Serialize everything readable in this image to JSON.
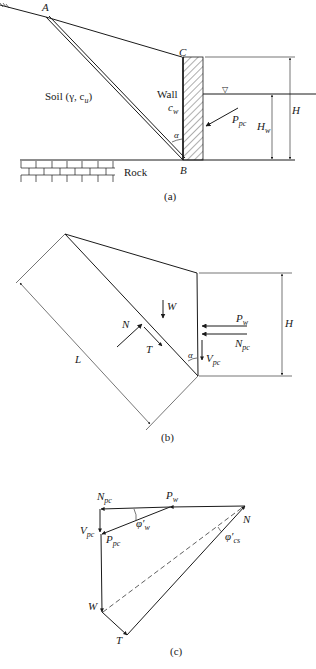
{
  "figure": {
    "panels": [
      {
        "id": "a",
        "caption": "(a)",
        "labels": {
          "point_a": "A",
          "point_b": "B",
          "point_c": "C",
          "soil": "Soil (γ, c",
          "soil_sub": "u",
          "soil_close": ")",
          "wall": "Wall",
          "wall_param": "c",
          "wall_param_sub": "w",
          "angle": "α",
          "rock": "Rock",
          "force_main": "P",
          "force_main_sub": "pc",
          "height_water": "H",
          "height_water_sub": "w",
          "height_total": "H",
          "water_table_symbol": "▽"
        }
      },
      {
        "id": "b",
        "caption": "(b)",
        "labels": {
          "weight": "W",
          "normal": "N",
          "shear": "T",
          "length": "L",
          "angle": "α",
          "water_force": "P",
          "water_force_sub": "w",
          "normal_wall": "N",
          "normal_wall_sub": "pc",
          "vertical_wall": "V",
          "vertical_wall_sub": "pc",
          "height": "H"
        }
      },
      {
        "id": "c",
        "caption": "(c)",
        "labels": {
          "normal_wall": "N",
          "normal_wall_sub": "pc",
          "water_force": "P",
          "water_force_sub": "w",
          "vertical_wall": "V",
          "vertical_wall_sub": "pc",
          "resultant_wall": "P",
          "resultant_wall_sub": "pc",
          "wall_friction": "φ′",
          "wall_friction_sub": "w",
          "normal": "N",
          "critical_friction": "φ′",
          "critical_friction_sub": "cs",
          "weight": "W",
          "shear": "T"
        }
      }
    ]
  }
}
